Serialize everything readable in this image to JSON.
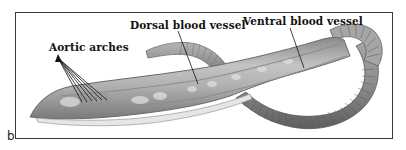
{
  "figure": {
    "panel_letter": "b",
    "labels": [
      {
        "id": "aortic",
        "text": "Aortic arches"
      },
      {
        "id": "dorsal",
        "text": "Dorsal blood vessel"
      },
      {
        "id": "ventral",
        "text": "Ventral blood vessel"
      }
    ]
  },
  "colors": {
    "frame": "#3a3a3a",
    "worm_body": "#9a9a9a",
    "worm_dark": "#6a6a6a",
    "worm_light": "#d0d0d0",
    "leader_line": "#111111"
  }
}
